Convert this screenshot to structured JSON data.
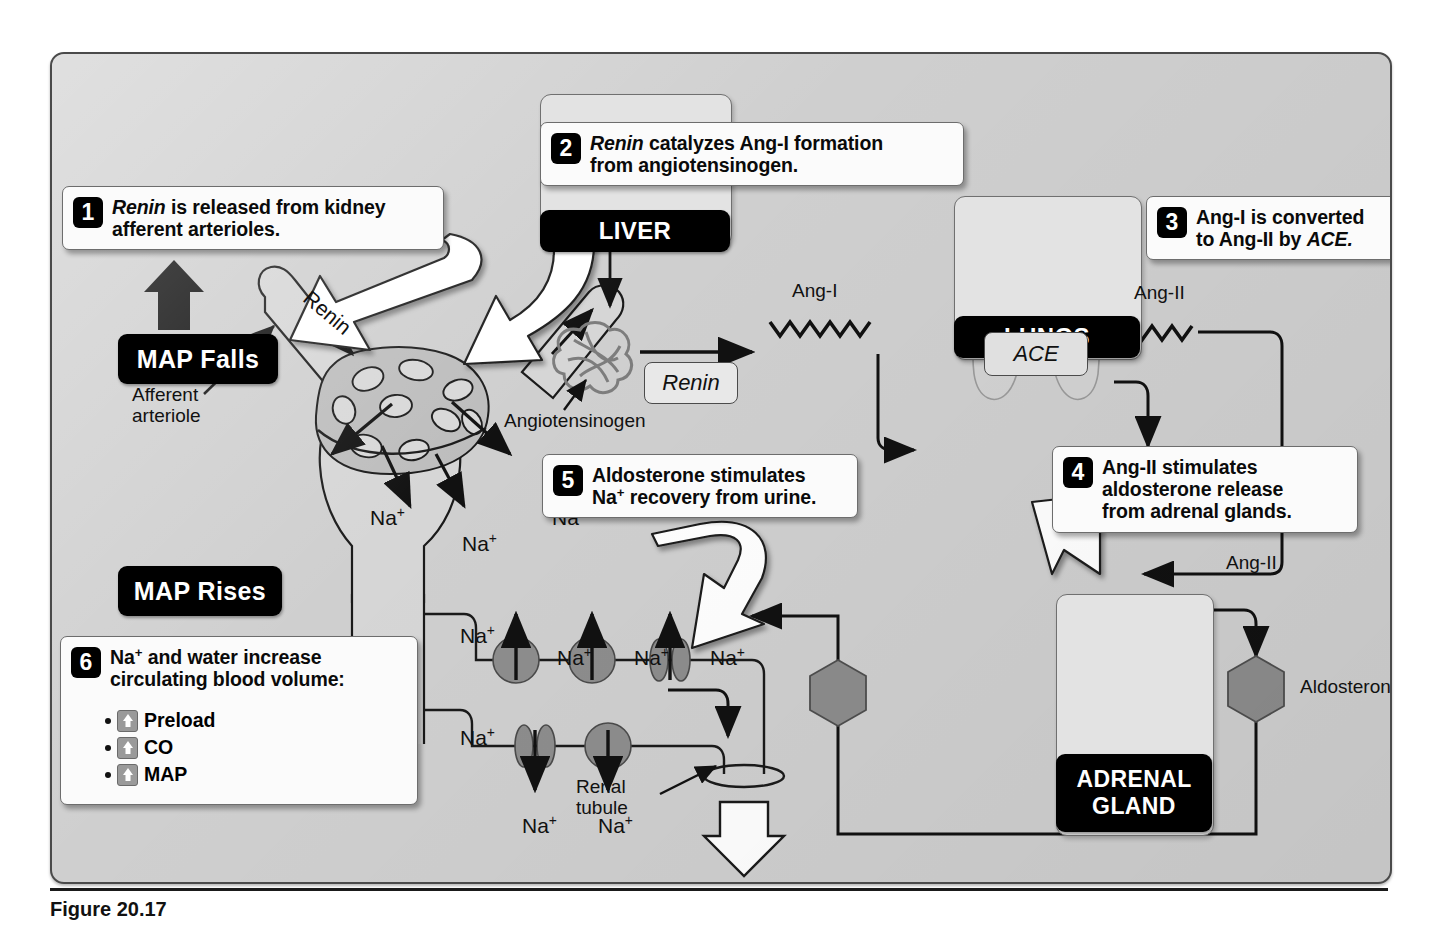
{
  "figure": {
    "caption": "Figure 20.17"
  },
  "colors": {
    "panel_bg": "#cfcfcf",
    "organ_tile": "#e3e3e3",
    "pill_bg": "#000000",
    "callout_bg": "#fbfbfb",
    "line": "#111111",
    "organ_fill": "#8f8f8f",
    "channel_fill": "#8a8a8a",
    "hex_fill": "#8c8c8c"
  },
  "callouts": [
    {
      "num": "1",
      "lines": [
        "Renin is released from kidney",
        "afferent arterioles."
      ],
      "italic_first_word": true
    },
    {
      "num": "2",
      "lines": [
        "Renin catalyzes Ang-I formation",
        "from angiotensinogen."
      ],
      "italic_first_word": true
    },
    {
      "num": "3",
      "lines": [
        "Ang-I is converted",
        "to Ang-II by ACE."
      ],
      "italic_first_word": false
    },
    {
      "num": "4",
      "lines": [
        "Ang-II stimulates",
        "aldosterone release",
        "from adrenal glands."
      ],
      "italic_first_word": false
    },
    {
      "num": "5",
      "lines": [
        "Aldosterone stimulates",
        "Na+ recovery from urine."
      ],
      "italic_first_word": false
    },
    {
      "num": "6",
      "lines": [
        "Na+ and water increase",
        "circulating blood volume:"
      ],
      "italic_first_word": false,
      "bullets": [
        "Preload",
        "CO",
        "MAP"
      ],
      "bullet_icon": "up-arrow-icon"
    }
  ],
  "pills": [
    {
      "id": "map-falls",
      "label": "MAP Falls"
    },
    {
      "id": "map-rises",
      "label": "MAP Rises"
    },
    {
      "id": "liver",
      "label": "LIVER"
    },
    {
      "id": "lungs",
      "label": "LUNGS"
    },
    {
      "id": "adrenal",
      "label": "ADRENAL\nGLAND",
      "line1": "ADRENAL",
      "line2": "GLAND"
    }
  ],
  "chips": [
    {
      "id": "renin-chip",
      "label": "Renin"
    },
    {
      "id": "ace-chip",
      "label": "ACE"
    }
  ],
  "labels": {
    "renin_on_arteriole": "Renin",
    "afferent_arteriole_l1": "Afferent",
    "afferent_arteriole_l2": "arteriole",
    "angiotensinogen": "Angiotensinogen",
    "ang_i": "Ang-I",
    "ang_ii_top": "Ang-II",
    "ang_ii_adrenal": "Ang-II",
    "aldosterone": "Aldosterone",
    "renal_tubule_l1": "Renal",
    "renal_tubule_l2": "tubule",
    "urine": "URINE",
    "sodium": "Na",
    "sodium_sup": "+"
  },
  "sodium_labels": [
    {
      "id": "na-glomerulus-left",
      "x": 318,
      "y": 452
    },
    {
      "id": "na-glomerulus-mid",
      "x": 410,
      "y": 478
    },
    {
      "id": "na-glomerulus-right",
      "x": 500,
      "y": 452
    },
    {
      "id": "na-tubule-upper",
      "x": 408,
      "y": 570
    },
    {
      "id": "na-tubule-lower",
      "x": 408,
      "y": 672
    },
    {
      "id": "na-apical-1",
      "x": 505,
      "y": 592
    },
    {
      "id": "na-apical-2",
      "x": 582,
      "y": 592
    },
    {
      "id": "na-apical-3",
      "x": 658,
      "y": 592
    },
    {
      "id": "na-basal-1",
      "x": 470,
      "y": 760
    },
    {
      "id": "na-basal-2",
      "x": 546,
      "y": 760
    }
  ],
  "organs": [
    {
      "id": "liver-tile",
      "label": "liver-illustration"
    },
    {
      "id": "lungs-tile",
      "label": "lungs-illustration"
    },
    {
      "id": "adrenal-tile",
      "label": "adrenal-gland-and-kidney-illustration"
    }
  ],
  "molecules": [
    {
      "id": "ang-i-zigzag",
      "name": "Ang-I"
    },
    {
      "id": "ang-ii-zigzag",
      "name": "Ang-II"
    },
    {
      "id": "aldosterone-hexagon-right",
      "name": "Aldosterone"
    },
    {
      "id": "aldosterone-hexagon-left",
      "name": "Aldosterone"
    }
  ]
}
